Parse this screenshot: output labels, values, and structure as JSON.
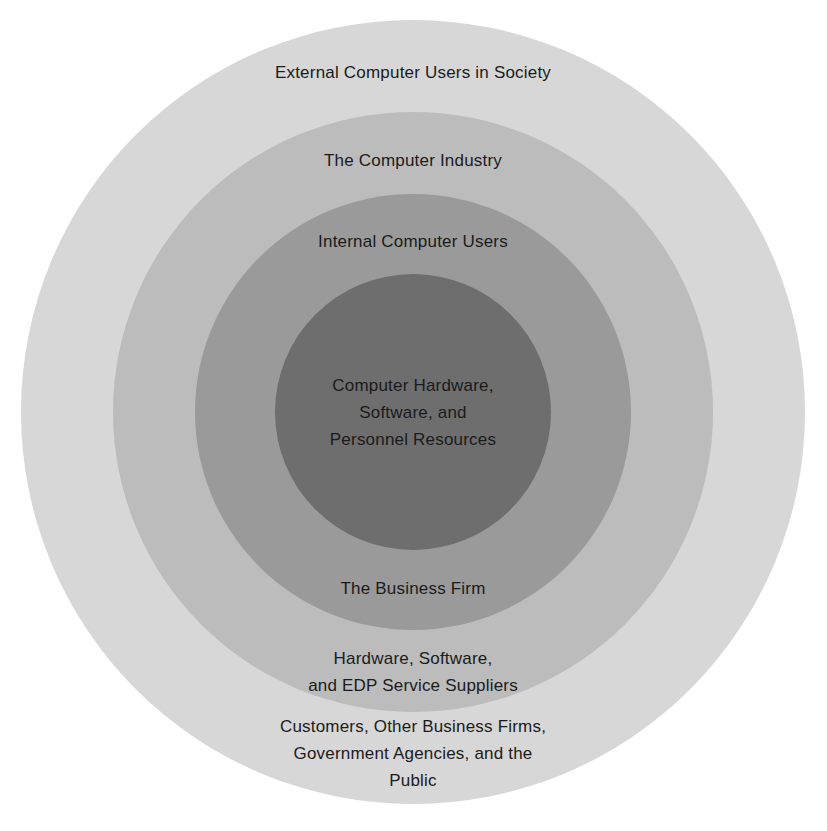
{
  "diagram": {
    "colors": {
      "background": "#ffffff",
      "outer_ring": "#d7d7d7",
      "industry_ring": "#bcbcbc",
      "internal_ring": "#9a9a9a",
      "core": "#6e6e6e",
      "text": "#1b1b1b"
    },
    "rings": [
      {
        "name": "outer-ring",
        "fill": "#d7d7d7",
        "diameter_px": 784
      },
      {
        "name": "industry-ring",
        "fill": "#bcbcbc",
        "diameter_px": 600
      },
      {
        "name": "internal-ring",
        "fill": "#9a9a9a",
        "diameter_px": 436
      },
      {
        "name": "core-circle",
        "fill": "#6e6e6e",
        "diameter_px": 276
      }
    ],
    "labels": {
      "external_users": "External Computer Users in Society",
      "computer_industry": "The Computer Industry",
      "internal_users": "Internal Computer Users",
      "core_line1": "Computer Hardware,",
      "core_line2": "Software, and",
      "core_line3": "Personnel Resources",
      "business_firm": "The Business Firm",
      "suppliers_line1": "Hardware, Software,",
      "suppliers_line2": "and EDP Service Suppliers",
      "customers_line1": "Customers, Other Business Firms,",
      "customers_line2": "Government Agencies, and the",
      "customers_line3": "Public"
    }
  }
}
